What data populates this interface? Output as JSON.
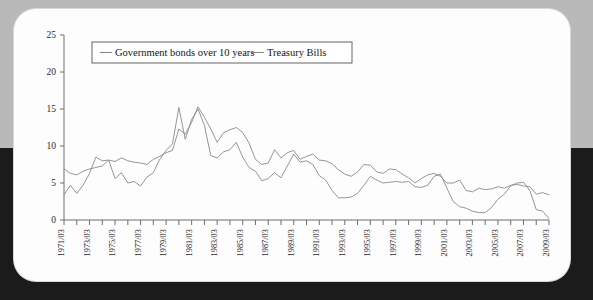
{
  "chart_data": {
    "type": "line",
    "title": "",
    "xlabel": "",
    "ylabel": "",
    "ylim": [
      0,
      25
    ],
    "yticks": [
      0,
      5,
      10,
      15,
      20,
      25
    ],
    "grid": false,
    "legend_position": "top-left-inside",
    "xtick_labels": [
      "1971/03",
      "1973/03",
      "1975/03",
      "1977/03",
      "1979/03",
      "1981/03",
      "1983/03",
      "1985/03",
      "1987/03",
      "1989/03",
      "1991/03",
      "1993/03",
      "1995/03",
      "1997/03",
      "1999/03",
      "2001/03",
      "2003/03",
      "2005/03",
      "2007/03",
      "2009/03"
    ],
    "x": [
      "1971/03",
      "1971/09",
      "1972/03",
      "1972/09",
      "1973/03",
      "1973/09",
      "1974/03",
      "1974/09",
      "1975/03",
      "1975/09",
      "1976/03",
      "1976/09",
      "1977/03",
      "1977/09",
      "1978/03",
      "1978/09",
      "1979/03",
      "1979/09",
      "1980/03",
      "1980/09",
      "1981/03",
      "1981/09",
      "1982/03",
      "1982/09",
      "1983/03",
      "1983/09",
      "1984/03",
      "1984/09",
      "1985/03",
      "1985/09",
      "1986/03",
      "1986/09",
      "1987/03",
      "1987/09",
      "1988/03",
      "1988/09",
      "1989/03",
      "1989/09",
      "1990/03",
      "1990/09",
      "1991/03",
      "1991/09",
      "1992/03",
      "1992/09",
      "1993/03",
      "1993/09",
      "1994/03",
      "1994/09",
      "1995/03",
      "1995/09",
      "1996/03",
      "1996/09",
      "1997/03",
      "1997/09",
      "1998/03",
      "1998/09",
      "1999/03",
      "1999/09",
      "2000/03",
      "2000/09",
      "2001/03",
      "2001/09",
      "2002/03",
      "2002/09",
      "2003/03",
      "2003/09",
      "2004/03",
      "2004/09",
      "2005/03",
      "2005/09",
      "2006/03",
      "2006/09",
      "2007/03",
      "2007/09",
      "2008/03",
      "2008/09",
      "2009/03"
    ],
    "series": [
      {
        "name": "Government bonds over 10 years",
        "values": [
          6.9,
          6.3,
          6.1,
          6.6,
          6.9,
          7.1,
          7.3,
          8.1,
          7.9,
          8.4,
          8.0,
          7.8,
          7.7,
          7.5,
          8.2,
          8.6,
          9.1,
          9.4,
          12.3,
          11.6,
          13.2,
          15.3,
          13.9,
          12.3,
          10.5,
          11.8,
          12.2,
          12.5,
          11.8,
          10.4,
          8.2,
          7.5,
          7.7,
          9.5,
          8.4,
          9.1,
          9.4,
          8.2,
          8.6,
          8.9,
          8.1,
          8.0,
          7.6,
          6.8,
          6.2,
          5.9,
          6.5,
          7.5,
          7.4,
          6.5,
          6.3,
          6.9,
          6.8,
          6.2,
          5.7,
          5.0,
          5.6,
          6.1,
          6.3,
          5.9,
          5.0,
          5.0,
          5.4,
          4.0,
          3.8,
          4.3,
          4.1,
          4.2,
          4.5,
          4.3,
          4.7,
          4.8,
          4.6,
          4.5,
          3.5,
          3.7,
          3.4
        ],
        "color": "#8a8a8a"
      },
      {
        "name": "Treasury Bills",
        "values": [
          3.4,
          4.7,
          3.6,
          4.7,
          6.3,
          8.5,
          8.0,
          8.1,
          5.6,
          6.4,
          5.0,
          5.2,
          4.6,
          5.8,
          6.4,
          8.2,
          9.4,
          10.3,
          15.2,
          10.9,
          13.6,
          15.0,
          12.8,
          8.7,
          8.4,
          9.2,
          9.5,
          10.5,
          8.5,
          7.1,
          6.6,
          5.3,
          5.6,
          6.4,
          5.7,
          7.3,
          8.9,
          7.8,
          8.0,
          7.5,
          6.0,
          5.4,
          4.0,
          3.0,
          3.0,
          3.1,
          3.6,
          4.7,
          5.9,
          5.4,
          5.0,
          5.1,
          5.2,
          5.1,
          5.2,
          4.5,
          4.4,
          4.7,
          5.9,
          6.2,
          4.3,
          2.5,
          1.8,
          1.6,
          1.2,
          1.0,
          1.0,
          1.7,
          2.8,
          3.5,
          4.6,
          5.0,
          5.1,
          4.0,
          1.4,
          1.2,
          0.2
        ],
        "color": "#8a8a8a"
      }
    ]
  },
  "legend": {
    "entries": [
      {
        "label": "Government bonds over 10 years"
      },
      {
        "label": "Treasury Bills"
      }
    ]
  }
}
